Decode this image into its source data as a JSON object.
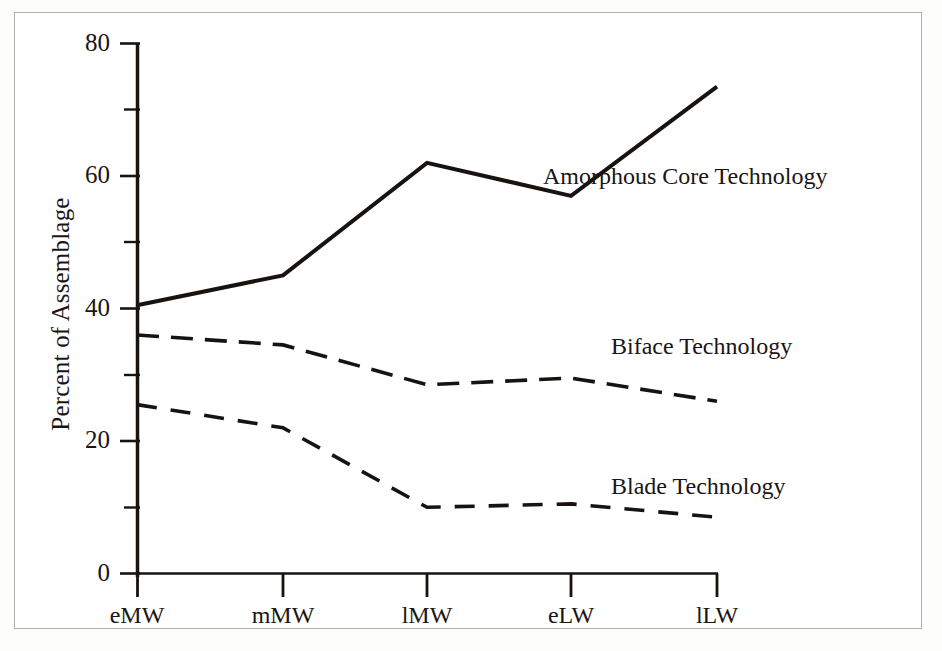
{
  "chart_data": {
    "type": "line",
    "title": "",
    "xlabel": "",
    "ylabel": "Percent of Assemblage",
    "categories": [
      "eMW",
      "mMW",
      "lMW",
      "eLW",
      "lLW"
    ],
    "ylim": [
      0,
      80
    ],
    "yticks": [
      0,
      20,
      40,
      60,
      80
    ],
    "yticks_minor": [
      10,
      30,
      50,
      70
    ],
    "ytick_labels": [
      "0",
      "20",
      "40",
      "60",
      "80"
    ],
    "grid": false,
    "legend": "inline-annotations",
    "series": [
      {
        "name": "Amorphous Core Technology",
        "style": "solid",
        "color": "#191310",
        "values": [
          40.5,
          45,
          62,
          57,
          73.5
        ]
      },
      {
        "name": "Biface Technology",
        "style": "long-dash",
        "color": "#191310",
        "values": [
          36,
          34.5,
          28.5,
          29.5,
          26
        ]
      },
      {
        "name": "Blade Technology",
        "style": "dashed",
        "color": "#191310",
        "values": [
          25.5,
          22,
          10,
          10.5,
          8.5
        ]
      }
    ],
    "annotations": [
      {
        "text": "Amorphous Core Technology",
        "x": 543,
        "y": 175
      },
      {
        "text": "Biface Technology",
        "x": 612,
        "y": 345
      },
      {
        "text": "Blade Technology",
        "x": 612,
        "y": 485
      }
    ]
  },
  "axis": {
    "y_label": "Percent of Assemblage",
    "tick_80": "80",
    "tick_60": "60",
    "tick_40": "40",
    "tick_20": "20",
    "tick_0": "0",
    "x_1": "eMW",
    "x_2": "mMW",
    "x_3": "lMW",
    "x_4": "eLW",
    "x_5": "lLW"
  },
  "labels": {
    "amorphous": "Amorphous Core Technology",
    "biface": "Biface Technology",
    "blade": "Blade Technology"
  }
}
